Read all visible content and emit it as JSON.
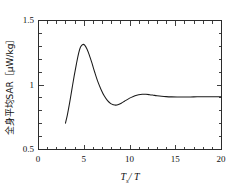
{
  "chart_data": {
    "type": "line",
    "title": "",
    "subtitle": "",
    "xlabel": "T_s / T",
    "xlabel_base": "T",
    "xlabel_sub": "s",
    "xlabel_tail": "/ T",
    "ylabel": "全身平均SAR［μW/kg］",
    "ylabel_text": "全身平均SAR",
    "ylabel_unit": "［μW/kg］",
    "xlim": [
      0,
      20
    ],
    "ylim": [
      0.5,
      1.5
    ],
    "xticks": [
      0,
      5,
      10,
      15,
      20
    ],
    "xtick_labels": [
      "0",
      "5",
      "10",
      "15",
      "20"
    ],
    "xminor_step": 1,
    "yticks": [
      0.5,
      1.0,
      1.5
    ],
    "ytick_labels": [
      "0.5",
      "1",
      "1.5"
    ],
    "yminor_step": 0.1,
    "grid": false,
    "legend": false,
    "legend_position": "none",
    "line_color": "#1a1a1a",
    "frame_color": "#2b2b2b",
    "background_color": "#ffffff",
    "series": [
      {
        "name": "全身平均SAR",
        "x": [
          3.0,
          3.2,
          3.45,
          3.7,
          3.95,
          4.2,
          4.45,
          4.65,
          4.9,
          5.1,
          5.35,
          5.6,
          5.9,
          6.2,
          6.55,
          6.9,
          7.25,
          7.6,
          7.95,
          8.25,
          8.5,
          8.8,
          9.1,
          9.45,
          9.8,
          10.2,
          10.6,
          11.0,
          11.4,
          11.8,
          12.2,
          12.6,
          13.0,
          13.5,
          14.0,
          14.6,
          15.2,
          16.0,
          17.0,
          18.0,
          19.0,
          20.0
        ],
        "y": [
          0.7,
          0.76,
          0.855,
          0.96,
          1.065,
          1.16,
          1.245,
          1.29,
          1.31,
          1.305,
          1.275,
          1.23,
          1.165,
          1.095,
          1.02,
          0.96,
          0.91,
          0.875,
          0.852,
          0.843,
          0.84,
          0.845,
          0.855,
          0.87,
          0.885,
          0.9,
          0.912,
          0.92,
          0.924,
          0.924,
          0.921,
          0.917,
          0.913,
          0.909,
          0.906,
          0.904,
          0.903,
          0.903,
          0.904,
          0.905,
          0.905,
          0.905
        ]
      }
    ]
  },
  "figure": {
    "plot_left_px": 38,
    "plot_right_px": 221,
    "plot_top_px": 20,
    "plot_bottom_px": 149
  }
}
